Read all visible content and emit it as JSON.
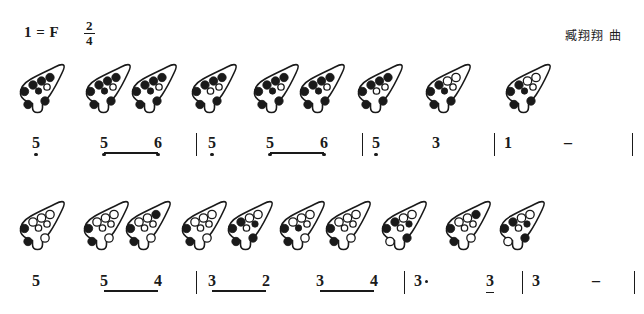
{
  "header": {
    "key_signature": "1 = F",
    "time_signature_numerator": "2",
    "time_signature_denominator": "4",
    "composer": "臧翔翔 曲"
  },
  "rows": [
    {
      "id": "row-1",
      "ocarina_top": 58,
      "note_top": 133,
      "ocarinas": [
        {
          "x": 14,
          "holes": "fffffoff"
        },
        {
          "x": 80,
          "holes": "fffffoff"
        },
        {
          "x": 126,
          "holes": "fffffoff"
        },
        {
          "x": 186,
          "holes": "ffffooff"
        },
        {
          "x": 248,
          "holes": "fffffoff"
        },
        {
          "x": 294,
          "holes": "fffffoff"
        },
        {
          "x": 352,
          "holes": "ffffooff"
        },
        {
          "x": 420,
          "holes": "ffoofoff"
        },
        {
          "x": 500,
          "holes": "ffoofoff"
        }
      ],
      "notes": [
        {
          "x": 36,
          "text": "5",
          "low": true,
          "beam": "none",
          "dotted": false
        },
        {
          "x": 104,
          "text": "5",
          "low": true,
          "beam": "start",
          "dotted": false
        },
        {
          "x": 158,
          "text": "6",
          "low": true,
          "beam": "end",
          "dotted": false
        },
        {
          "x": 212,
          "text": "5",
          "low": true,
          "beam": "none",
          "dotted": false
        },
        {
          "x": 270,
          "text": "5",
          "low": true,
          "beam": "start",
          "dotted": false
        },
        {
          "x": 324,
          "text": "6",
          "low": true,
          "beam": "end",
          "dotted": false
        },
        {
          "x": 376,
          "text": "5",
          "low": true,
          "beam": "none",
          "dotted": false
        },
        {
          "x": 436,
          "text": "3",
          "low": false,
          "beam": "none",
          "dotted": false
        },
        {
          "x": 508,
          "text": "1",
          "low": false,
          "beam": "none",
          "dotted": false
        }
      ],
      "dashes": [
        {
          "x": 568,
          "text": "–"
        }
      ],
      "beams": [
        {
          "x": 104,
          "width": 54
        },
        {
          "x": 270,
          "width": 54
        }
      ],
      "barlines": [
        196,
        362,
        494,
        632
      ]
    },
    {
      "id": "row-2",
      "ocarina_top": 195,
      "note_top": 271,
      "ocarinas": [
        {
          "x": 14,
          "holes": "fooooofo"
        },
        {
          "x": 78,
          "holes": "fooooofo"
        },
        {
          "x": 120,
          "holes": "foofoofo"
        },
        {
          "x": 176,
          "holes": "fooooofo"
        },
        {
          "x": 222,
          "holes": "ffooofff"
        },
        {
          "x": 274,
          "holes": "fooofofo"
        },
        {
          "x": 320,
          "holes": "fooooofo"
        },
        {
          "x": 376,
          "holes": "ffooofof"
        },
        {
          "x": 440,
          "holes": "foofoofo"
        },
        {
          "x": 494,
          "holes": "ffooofof"
        }
      ],
      "notes": [
        {
          "x": 36,
          "text": "5",
          "low": false,
          "beam": "none",
          "dotted": false
        },
        {
          "x": 104,
          "text": "5",
          "low": false,
          "beam": "start",
          "dotted": false
        },
        {
          "x": 158,
          "text": "4",
          "low": false,
          "beam": "end",
          "dotted": false
        },
        {
          "x": 212,
          "text": "3",
          "low": false,
          "beam": "start",
          "dotted": false
        },
        {
          "x": 266,
          "text": "2",
          "low": false,
          "beam": "end",
          "dotted": false
        },
        {
          "x": 320,
          "text": "3",
          "low": false,
          "beam": "start",
          "dotted": false
        },
        {
          "x": 374,
          "text": "4",
          "low": false,
          "beam": "end",
          "dotted": false
        },
        {
          "x": 418,
          "text": "3",
          "low": false,
          "beam": "none",
          "dotted": true
        },
        {
          "x": 490,
          "text": "3",
          "low": false,
          "beam": "single",
          "dotted": false
        },
        {
          "x": 536,
          "text": "3",
          "low": false,
          "beam": "none",
          "dotted": false
        }
      ],
      "dashes": [
        {
          "x": 596,
          "text": "–"
        }
      ],
      "beams": [
        {
          "x": 104,
          "width": 54
        },
        {
          "x": 212,
          "width": 54
        },
        {
          "x": 320,
          "width": 54
        }
      ],
      "barlines": [
        196,
        404,
        522,
        634
      ]
    }
  ]
}
